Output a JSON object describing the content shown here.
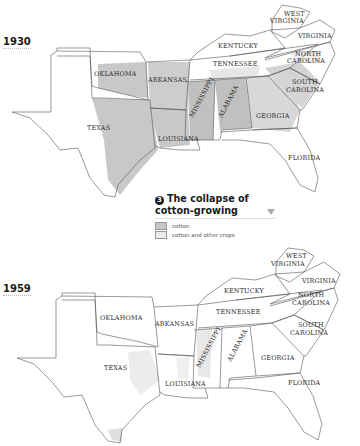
{
  "maps": [
    {
      "year": "1930",
      "states": [
        "WEST VIRGINIA",
        "VIRGINIA",
        "KENTUCKY",
        "NORTH CAROLINA",
        "OKLAHOMA",
        "ARKANSAS",
        "TENNESSEE",
        "SOUTH CAROLINA",
        "MISSISSIPPI",
        "ALABAMA",
        "TEXAS",
        "LOUISIANA",
        "GEORGIA",
        "FLORIDA"
      ]
    },
    {
      "year": "1959",
      "states": [
        "WEST VIRGINIA",
        "VIRGINIA",
        "KENTUCKY",
        "NORTH CAROLINA",
        "OKLAHOMA",
        "ARKANSAS",
        "TENNESSEE",
        "SOUTH CAROLINA",
        "MISSISSIPPI",
        "ALABAMA",
        "GEORGIA",
        "TEXAS",
        "LOUISIANA",
        "FLORIDA"
      ]
    }
  ],
  "legend": {
    "number": "3",
    "title_line1": "The collapse of",
    "title_line2": "cotton-growing",
    "items": [
      {
        "label": "cotton",
        "color": "#c8c8c8"
      },
      {
        "label": "cotton and other crops",
        "color": "#ececec"
      }
    ]
  },
  "labels": {
    "wv1": "WEST",
    "wv2": "VIRGINIA",
    "va": "VIRGINIA",
    "ky": "KENTUCKY",
    "nc1": "NORTH",
    "nc2": "CAROLINA",
    "ok": "OKLAHOMA",
    "ar": "ARKANSAS",
    "tn": "TENNESSEE",
    "sc1": "SOUTH",
    "sc2": "CAROLINA",
    "ms": "MISSISSIPPI",
    "al": "ALABAMA",
    "tx": "TEXAS",
    "la": "LOUISIANA",
    "ga": "GEORGIA",
    "fl": "FLORIDA"
  },
  "colors": {
    "cotton": "#c8c8c8",
    "cotton_other": "#ececec",
    "border": "#555555"
  }
}
